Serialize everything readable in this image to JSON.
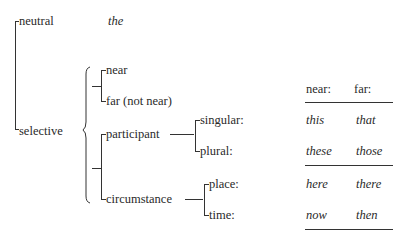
{
  "diagram": {
    "root": {
      "options": [
        {
          "label": "neutral",
          "realization": "the"
        },
        {
          "label": "selective"
        }
      ]
    },
    "selective_systems": {
      "proximity": [
        "near",
        "far (not near)"
      ],
      "type": [
        "participant",
        "circumstance"
      ],
      "participant": [
        "singular:",
        "plural:"
      ],
      "circumstance": [
        "place:",
        "time:"
      ]
    },
    "table": {
      "headers": [
        "near:",
        "far:"
      ],
      "rows": [
        [
          "this",
          "that"
        ],
        [
          "these",
          "those"
        ],
        [
          "here",
          "there"
        ],
        [
          "now",
          "then"
        ]
      ]
    }
  }
}
